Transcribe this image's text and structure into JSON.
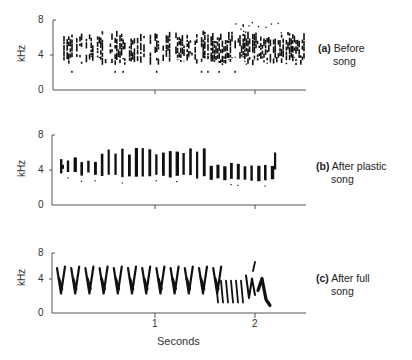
{
  "chart_data": [
    {
      "type": "heatmap",
      "subtype": "sound spectrogram",
      "title": "(a) Before song",
      "panel_label": "(a)",
      "caption": "Before song",
      "ylabel": "kHz",
      "yticks": [
        0,
        4,
        8
      ],
      "ylim": [
        0,
        8
      ],
      "xlim": [
        0,
        2.5
      ],
      "xticks": [
        1,
        2
      ],
      "description": "Dense noisy subsong energy spanning ~2-6.5 kHz across ~0.05-2.5 s",
      "energy_band_khz": [
        2,
        6.5
      ],
      "time_span_s": [
        0.05,
        2.5
      ]
    },
    {
      "type": "heatmap",
      "subtype": "sound spectrogram",
      "title": "(b) After plastic song",
      "panel_label": "(b)",
      "caption": "After plastic song",
      "ylabel": "kHz",
      "yticks": [
        0,
        4,
        8
      ],
      "ylim": [
        0,
        8
      ],
      "xlim": [
        0,
        2.5
      ],
      "xticks": [
        1,
        2
      ],
      "description": "Series of discrete vertical syllables, ~3-6.5 kHz, ~0.05-2.2 s",
      "syllable_count_approx": 30,
      "energy_band_khz": [
        3,
        6.5
      ],
      "time_span_s": [
        0.05,
        2.2
      ]
    },
    {
      "type": "heatmap",
      "subtype": "sound spectrogram",
      "title": "(c) After full song",
      "panel_label": "(c)",
      "caption": "After full song",
      "ylabel": "kHz",
      "yticks": [
        0,
        4,
        8
      ],
      "ylim": [
        0,
        8
      ],
      "xlim": [
        0,
        2.5
      ],
      "xticks": [
        1,
        2
      ],
      "xlabel": "Seconds",
      "description": "Stereotyped V-shaped syllables ~2-6.5 kHz, trill and terminal flourish near 2 s",
      "energy_band_khz": [
        2,
        6.5
      ],
      "time_span_s": [
        0.05,
        2.1
      ]
    }
  ],
  "panels": [
    {
      "label": "(a)",
      "line1": "Before",
      "line2": "song"
    },
    {
      "label": "(b)",
      "line1": "After plastic",
      "line2": "song"
    },
    {
      "label": "(c)",
      "line1": "After full",
      "line2": "song"
    }
  ],
  "axes": {
    "ylabel": "kHz",
    "yticks": [
      "8",
      "4",
      "0"
    ],
    "xticks": [
      "1",
      "2"
    ],
    "xlabel": "Seconds"
  },
  "colors": {
    "ink": "#111111",
    "axis": "#555555",
    "background": "#ffffff"
  }
}
